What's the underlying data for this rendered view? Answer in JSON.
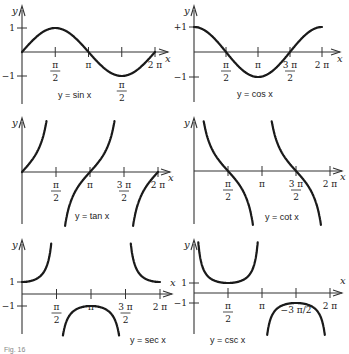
{
  "figure_caption": "Fig. 16",
  "chart_data": [
    {
      "type": "line",
      "title": "y = sin x",
      "function": "sin",
      "xlabel": "x",
      "ylabel": "y",
      "x_range": [
        0,
        6.2832
      ],
      "y_range": [
        -1,
        1
      ],
      "x_ticks": [
        {
          "value": 1.5708,
          "num": "π",
          "den": "2",
          "pos": "below"
        },
        {
          "value": 3.1416,
          "num": "π",
          "den": "",
          "pos": "below"
        },
        {
          "value": 4.7124,
          "num": "π",
          "den": "2",
          "pos": "below"
        },
        {
          "value": 6.2832,
          "num": "2 π",
          "den": "",
          "pos": "below"
        }
      ],
      "y_ticks": [
        {
          "value": 1,
          "label": "1"
        },
        {
          "value": -1,
          "label": "−1"
        }
      ],
      "points": [
        [
          0,
          0
        ],
        [
          1.5708,
          1
        ],
        [
          3.1416,
          0
        ],
        [
          4.7124,
          -1
        ],
        [
          6.2832,
          0
        ]
      ]
    },
    {
      "type": "line",
      "title": "y = cos x",
      "function": "cos",
      "xlabel": "x",
      "ylabel": "y",
      "x_range": [
        0,
        6.2832
      ],
      "y_range": [
        -1,
        1
      ],
      "x_ticks": [
        {
          "value": 1.5708,
          "num": "π",
          "den": "2"
        },
        {
          "value": 3.1416,
          "num": "π",
          "den": ""
        },
        {
          "value": 4.7124,
          "num": "3 π",
          "den": "2"
        },
        {
          "value": 6.2832,
          "num": "2 π",
          "den": ""
        }
      ],
      "y_ticks": [
        {
          "value": 1,
          "label": "+1"
        },
        {
          "value": -1,
          "label": "−1"
        }
      ],
      "points": [
        [
          0,
          1
        ],
        [
          1.5708,
          0
        ],
        [
          3.1416,
          -1
        ],
        [
          4.7124,
          0
        ],
        [
          6.2832,
          1
        ]
      ]
    },
    {
      "type": "line",
      "title": "y = tan x",
      "function": "tan",
      "xlabel": "x",
      "ylabel": "y",
      "x_range": [
        0,
        6.2832
      ],
      "asymptotes": [
        1.5708,
        4.7124
      ],
      "x_ticks": [
        {
          "value": 1.5708,
          "num": "π",
          "den": "2"
        },
        {
          "value": 3.1416,
          "num": "π",
          "den": ""
        },
        {
          "value": 4.7124,
          "num": "3 π",
          "den": "2"
        },
        {
          "value": 6.2832,
          "num": "2 π",
          "den": ""
        }
      ],
      "y_ticks": []
    },
    {
      "type": "line",
      "title": "y = cot x",
      "function": "cot",
      "xlabel": "x",
      "ylabel": "y",
      "x_range": [
        0,
        6.2832
      ],
      "asymptotes": [
        0,
        3.1416,
        6.2832
      ],
      "x_ticks": [
        {
          "value": 1.5708,
          "num": "π",
          "den": "2"
        },
        {
          "value": 3.1416,
          "num": "π",
          "den": ""
        },
        {
          "value": 4.7124,
          "num": "3 π",
          "den": "2"
        },
        {
          "value": 6.2832,
          "num": "2 π",
          "den": ""
        }
      ],
      "y_ticks": []
    },
    {
      "type": "line",
      "title": "y = sec x",
      "function": "sec",
      "xlabel": "x",
      "ylabel": "y",
      "x_range": [
        0,
        6.2832
      ],
      "asymptotes": [
        1.5708,
        4.7124
      ],
      "x_ticks": [
        {
          "value": 1.5708,
          "num": "π",
          "den": "2"
        },
        {
          "value": 3.1416,
          "num": "π",
          "den": ""
        },
        {
          "value": 4.7124,
          "num": "3 π",
          "den": "2"
        },
        {
          "value": 6.2832,
          "num": "2 π",
          "den": ""
        }
      ],
      "y_ticks": [
        {
          "value": 1,
          "label": "1"
        },
        {
          "value": -1,
          "label": "−1"
        }
      ]
    },
    {
      "type": "line",
      "title": "y = csc x",
      "function": "csc",
      "xlabel": "x",
      "ylabel": "y",
      "x_range": [
        0,
        6.2832
      ],
      "asymptotes": [
        0,
        3.1416,
        6.2832
      ],
      "x_ticks": [
        {
          "value": 1.5708,
          "num": "π",
          "den": "2"
        },
        {
          "value": 3.1416,
          "num": "π",
          "den": ""
        },
        {
          "value": 4.7124,
          "num": "−3 π/2",
          "den": "",
          "pos": "below-curve"
        },
        {
          "value": 6.2832,
          "num": "2 π",
          "den": ""
        }
      ],
      "y_ticks": [
        {
          "value": 1,
          "label": "1"
        },
        {
          "value": -1,
          "label": "−1"
        }
      ]
    }
  ]
}
